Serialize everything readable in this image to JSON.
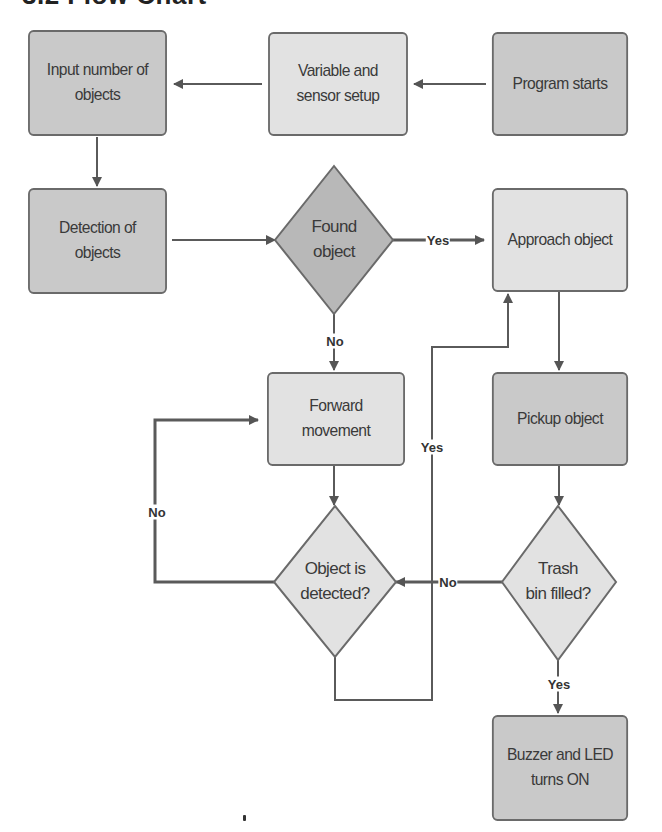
{
  "title": "3.2 Flow Chart",
  "colors": {
    "process_dark": "#c9c9c9",
    "process_light": "#e2e2e2",
    "decision_dark": "#b8b8b8",
    "decision_light": "#e2e2e2",
    "stroke": "#6a6a6a",
    "text": "#3a3a3a"
  },
  "nodes": {
    "program_starts": {
      "label": "Program starts",
      "shape": "process"
    },
    "variable_setup": {
      "label": "Variable and sensor setup",
      "line1": "Variable and",
      "line2": "sensor setup",
      "shape": "process"
    },
    "input_objects": {
      "label": "Input number of objects",
      "line1": "Input number of",
      "line2": "objects",
      "shape": "process"
    },
    "detection": {
      "label": "Detection of objects",
      "line1": "Detection of",
      "line2": "objects",
      "shape": "process"
    },
    "found_object": {
      "label": "Found object",
      "line1": "Found",
      "line2": "object",
      "shape": "decision"
    },
    "approach": {
      "label": "Approach object",
      "shape": "process"
    },
    "forward": {
      "label": "Forward movement",
      "line1": "Forward",
      "line2": "movement",
      "shape": "process"
    },
    "pickup": {
      "label": "Pickup object",
      "shape": "process"
    },
    "object_detected": {
      "label": "Object is detected?",
      "line1": "Object is",
      "line2": "detected?",
      "shape": "decision"
    },
    "trash_filled": {
      "label": "Trash bin filled?",
      "line1": "Trash",
      "line2": "bin filled?",
      "shape": "decision"
    },
    "buzzer": {
      "label": "Buzzer and LED turns ON",
      "line1": "Buzzer and LED",
      "line2": "turns ON",
      "shape": "process"
    }
  },
  "edges": [
    {
      "from": "program_starts",
      "to": "variable_setup",
      "label": ""
    },
    {
      "from": "variable_setup",
      "to": "input_objects",
      "label": ""
    },
    {
      "from": "input_objects",
      "to": "detection",
      "label": ""
    },
    {
      "from": "detection",
      "to": "found_object",
      "label": ""
    },
    {
      "from": "found_object",
      "to": "approach",
      "label": "Yes"
    },
    {
      "from": "found_object",
      "to": "forward",
      "label": "No"
    },
    {
      "from": "approach",
      "to": "pickup",
      "label": ""
    },
    {
      "from": "pickup",
      "to": "trash_filled",
      "label": ""
    },
    {
      "from": "trash_filled",
      "to": "object_detected",
      "label": "No"
    },
    {
      "from": "trash_filled",
      "to": "buzzer",
      "label": "Yes"
    },
    {
      "from": "forward",
      "to": "object_detected",
      "label": ""
    },
    {
      "from": "object_detected",
      "to": "forward",
      "label": "No"
    },
    {
      "from": "object_detected",
      "to": "approach",
      "label": "Yes"
    }
  ],
  "edge_labels": {
    "found_yes": "Yes",
    "found_no": "No",
    "trash_no": "No",
    "trash_yes": "Yes",
    "detected_no": "No",
    "detected_yes": "Yes"
  }
}
